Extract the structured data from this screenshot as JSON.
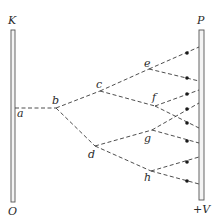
{
  "diagram": {
    "type": "electron-avalanche",
    "electrodes": {
      "cathode": {
        "top_label": "K",
        "bottom_label": "O"
      },
      "anode": {
        "top_label": "P",
        "bottom_label": "+V"
      }
    },
    "nodes": [
      {
        "id": "a",
        "label": "a"
      },
      {
        "id": "b",
        "label": "b"
      },
      {
        "id": "c",
        "label": "c"
      },
      {
        "id": "d",
        "label": "d"
      },
      {
        "id": "e",
        "label": "e"
      },
      {
        "id": "f",
        "label": "f"
      },
      {
        "id": "g",
        "label": "g"
      },
      {
        "id": "h",
        "label": "h"
      }
    ],
    "edges": [
      [
        "a",
        "b"
      ],
      [
        "b",
        "c"
      ],
      [
        "b",
        "d"
      ],
      [
        "c",
        "e"
      ],
      [
        "c",
        "f"
      ],
      [
        "d",
        "g"
      ],
      [
        "d",
        "h"
      ],
      [
        "e",
        "P1"
      ],
      [
        "e",
        "P2"
      ],
      [
        "f",
        "P3"
      ],
      [
        "f",
        "P5"
      ],
      [
        "g",
        "P4"
      ],
      [
        "g",
        "P6"
      ],
      [
        "h",
        "P7"
      ],
      [
        "h",
        "P8"
      ]
    ],
    "collected_electrons": 8
  }
}
